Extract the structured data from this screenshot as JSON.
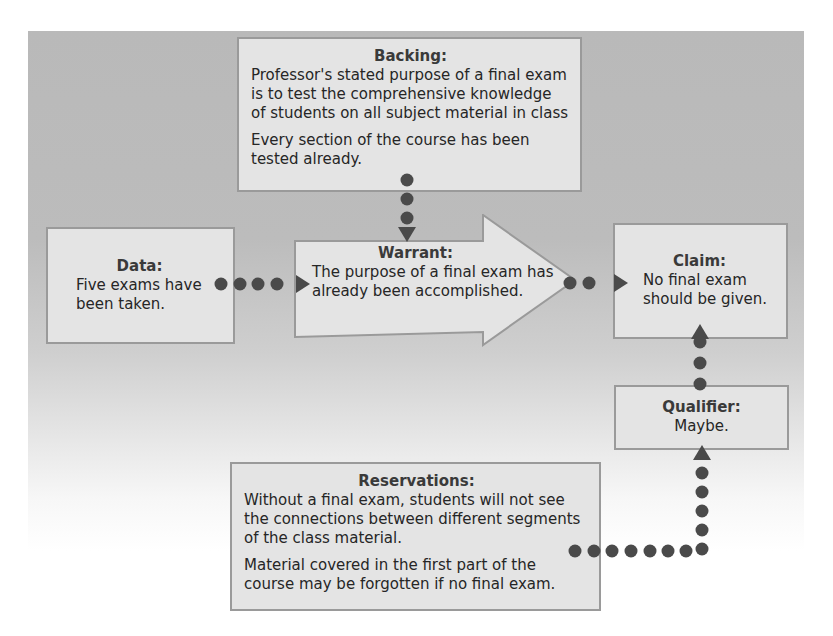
{
  "diagram": {
    "type": "toulmin-argument-model",
    "colors": {
      "background_top": "#b9b9b9",
      "box_fill": "#e4e4e4",
      "box_border": "#9a9a9a",
      "connector": "#4a4a4a"
    },
    "backing": {
      "title": "Backing:",
      "paragraphs": [
        "Professor's stated purpose of a final exam is to test the comprehensive knowledge of students on all subject material in class",
        "Every section of the course has been tested already."
      ]
    },
    "data": {
      "title": "Data:",
      "text": "Five exams have been taken."
    },
    "warrant": {
      "title": "Warrant:",
      "lines": [
        "The purpose of a final exam has",
        "already been accomplished."
      ]
    },
    "claim": {
      "title": "Claim:",
      "text": "No final exam should be given."
    },
    "qualifier": {
      "title": "Qualifier:",
      "text": "Maybe."
    },
    "reservations": {
      "title": "Reservations:",
      "paragraphs": [
        "Without a final exam, students will not see the connections between different segments of the class material.",
        "Material covered in the first part of the course may be forgotten if no final exam."
      ]
    },
    "connections": [
      {
        "from": "data",
        "to": "warrant",
        "style": "dotted-arrow"
      },
      {
        "from": "backing",
        "to": "warrant",
        "style": "dotted-arrow"
      },
      {
        "from": "warrant",
        "to": "claim",
        "style": "dotted-arrow"
      },
      {
        "from": "qualifier",
        "to": "claim",
        "style": "dotted-arrow"
      },
      {
        "from": "reservations",
        "to": "qualifier",
        "style": "dotted-arrow"
      }
    ]
  }
}
